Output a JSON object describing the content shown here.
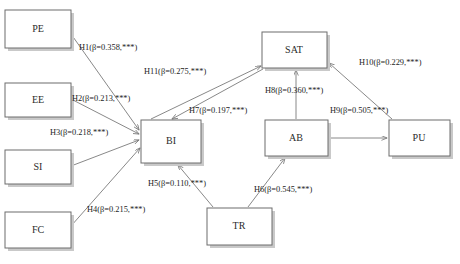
{
  "diagram": {
    "type": "path-diagram",
    "significance_marker": "***",
    "nodes": [
      {
        "id": "PE",
        "label": "PE",
        "x": 5,
        "y": 10,
        "w": 66,
        "h": 38
      },
      {
        "id": "EE",
        "label": "EE",
        "x": 5,
        "y": 83,
        "w": 66,
        "h": 34
      },
      {
        "id": "SI",
        "label": "SI",
        "x": 5,
        "y": 150,
        "w": 66,
        "h": 34
      },
      {
        "id": "FC",
        "label": "FC",
        "x": 5,
        "y": 212,
        "w": 66,
        "h": 36
      },
      {
        "id": "BI",
        "label": "BI",
        "x": 141,
        "y": 120,
        "w": 60,
        "h": 43
      },
      {
        "id": "SAT",
        "label": "SAT",
        "x": 262,
        "y": 32,
        "w": 65,
        "h": 36
      },
      {
        "id": "AB",
        "label": "AB",
        "x": 265,
        "y": 120,
        "w": 63,
        "h": 36
      },
      {
        "id": "PU",
        "label": "PU",
        "x": 389,
        "y": 120,
        "w": 61,
        "h": 36
      },
      {
        "id": "TR",
        "label": "TR",
        "x": 207,
        "y": 208,
        "w": 65,
        "h": 37
      }
    ],
    "edges": [
      {
        "id": "H1",
        "hypothesis": "H1",
        "from": "PE",
        "to": "BI",
        "beta": "0.358",
        "sig": "***",
        "label": "H1(β=0.358,***)",
        "label_x": 79,
        "label_y": 50
      },
      {
        "id": "H2",
        "hypothesis": "H2",
        "from": "EE",
        "to": "BI",
        "beta": "0.213",
        "sig": "***",
        "label": "H2(β=0.213,***)",
        "label_x": 72,
        "label_y": 101
      },
      {
        "id": "H3",
        "hypothesis": "H3",
        "from": "SI",
        "to": "BI",
        "beta": "0.218",
        "sig": "***",
        "label": "H3(β=0.218,***)",
        "label_x": 50,
        "label_y": 135
      },
      {
        "id": "H4",
        "hypothesis": "H4",
        "from": "FC",
        "to": "BI",
        "beta": "0.215",
        "sig": "***",
        "label": "H4(β=0.215,***)",
        "label_x": 87,
        "label_y": 212
      },
      {
        "id": "H5",
        "hypothesis": "H5",
        "from": "TR",
        "to": "BI",
        "beta": "0.110",
        "sig": "***",
        "label": "H5(β=0.110,***)",
        "label_x": 148,
        "label_y": 186
      },
      {
        "id": "H6",
        "hypothesis": "H6",
        "from": "TR",
        "to": "AB",
        "beta": "0.545",
        "sig": "***",
        "label": "H6(β=0.545,***)",
        "label_x": 254,
        "label_y": 192
      },
      {
        "id": "H7",
        "hypothesis": "H7",
        "from": "SAT",
        "to": "BI",
        "beta": "0.197",
        "sig": "***",
        "label": "H7(β=0.197,***)",
        "label_x": 189,
        "label_y": 113
      },
      {
        "id": "H8",
        "hypothesis": "H8",
        "from": "AB",
        "to": "SAT",
        "beta": "0.360",
        "sig": "***",
        "label": "H8(β=0.360,***)",
        "label_x": 265,
        "label_y": 93
      },
      {
        "id": "H9",
        "hypothesis": "H9",
        "from": "AB",
        "to": "PU",
        "beta": "0.505",
        "sig": "***",
        "label": "H9(β=0.505,***)",
        "label_x": 330,
        "label_y": 113
      },
      {
        "id": "H10",
        "hypothesis": "H10",
        "from": "PU",
        "to": "SAT",
        "beta": "0.229",
        "sig": "***",
        "label": "H10(β=0.229,***)",
        "label_x": 359,
        "label_y": 65
      },
      {
        "id": "H11",
        "hypothesis": "H11",
        "from": "BI",
        "to": "SAT",
        "beta": "0.275",
        "sig": "***",
        "label": "H11(β=0.275,***)",
        "label_x": 144,
        "label_y": 74
      }
    ]
  }
}
